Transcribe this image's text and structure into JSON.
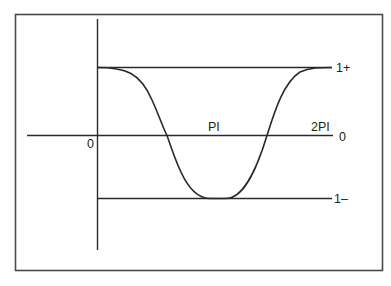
{
  "diagram": {
    "type": "waveform",
    "colors": {
      "stroke": "#2a2a2a",
      "frame": "#4a4a4a",
      "background": "#ffffff"
    },
    "labels": {
      "origin": "0",
      "x_pi": "PI",
      "x_two_pi": "2PI",
      "zero_level": "0",
      "upper_level": "1+",
      "lower_level": "1–"
    },
    "levels": {
      "upper": 1,
      "zero": 0,
      "lower": -1
    },
    "x_range": [
      0,
      6.2832
    ],
    "curve_description": "Smooth raised-cosine-like waveform starting at 1+ at x=0, descending through 0 to 1– near PI, and rising back to 1+ at 2PI"
  }
}
